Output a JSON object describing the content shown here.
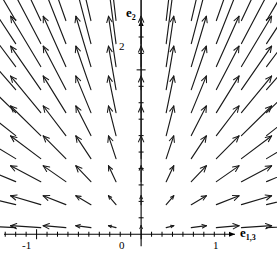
{
  "chart_data": {
    "type": "quiver",
    "title": "",
    "xlabel": "e_{1,3}",
    "ylabel": "e_2",
    "xlim": [
      -1.35,
      1.3
    ],
    "ylim": [
      -0.35,
      2.85
    ],
    "grid": false,
    "legend": null,
    "axes": {
      "x_axis_value": 0,
      "y_axis_value": 0,
      "x_major_ticks": [
        -1,
        0,
        1
      ],
      "x_minor_tick_step": 0.1,
      "y_major_ticks": [
        2
      ],
      "y_minor_tick_step": 0.2
    },
    "x": [
      -1.2,
      -0.96,
      -0.72,
      -0.48,
      -0.24,
      0.0,
      0.24,
      0.48,
      0.72,
      0.96,
      1.2
    ],
    "y": [
      0.08,
      0.36,
      0.64,
      0.92,
      1.2,
      1.48,
      1.76,
      2.04,
      2.32,
      2.6
    ],
    "vector_rule": "u = x, v = y (radial outward field), arrow length proportional to sqrt(x^2 + y^2)",
    "arrow_color": "#1a1a1a",
    "axis_color": "#000000",
    "background_color": "#ffffff"
  },
  "labels": {
    "y_axis": {
      "base": "e",
      "subscript": "2"
    },
    "x_axis": {
      "base": "e",
      "subscript": "1,3"
    }
  },
  "tick_labels": {
    "x": {
      "minus_one": "-1",
      "zero": "0",
      "one": "1"
    },
    "y": {
      "two": "2"
    }
  }
}
